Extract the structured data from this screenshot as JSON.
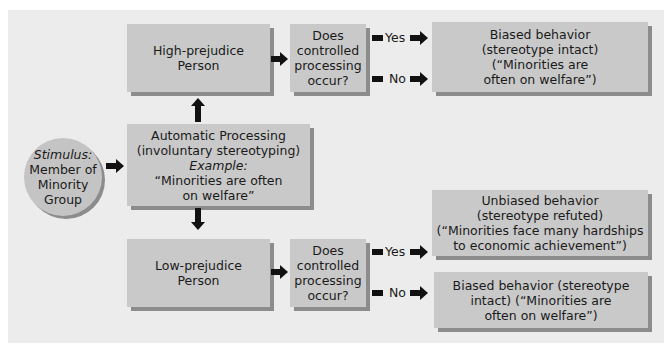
{
  "stimulus": {
    "label": "Stimulus:",
    "lines": [
      "Member of",
      "Minority",
      "Group"
    ]
  },
  "automatic": {
    "lines": [
      "Automatic Processing",
      "(involuntary stereotyping)"
    ],
    "example_label": "Example:",
    "example_lines": [
      "“Minorities are often",
      "on welfare”"
    ]
  },
  "high": {
    "person_lines": [
      "High-prejudice",
      "Person"
    ],
    "question_lines": [
      "Does",
      "controlled",
      "processing",
      "occur?"
    ],
    "yes_label": "Yes",
    "no_label": "No",
    "outcome_lines": [
      "Biased behavior",
      "(stereotype intact)",
      "(“Minorities are",
      "often on welfare”)"
    ]
  },
  "low": {
    "person_lines": [
      "Low-prejudice",
      "Person"
    ],
    "question_lines": [
      "Does",
      "controlled",
      "processing",
      "occur?"
    ],
    "yes_label": "Yes",
    "no_label": "No",
    "yes_outcome_lines": [
      "Unbiased behavior",
      "(stereotype refuted)",
      "(“Minorities face many hardships",
      "to economic achievement”)"
    ],
    "no_outcome_lines": [
      "Biased behavior (stereotype",
      "intact) (“Minorities are",
      "often on welfare”)"
    ]
  },
  "colors": {
    "panel": "#ececec",
    "box": "#c9c9c9",
    "shadow": "#8c8c8c",
    "arrow": "#111111"
  }
}
